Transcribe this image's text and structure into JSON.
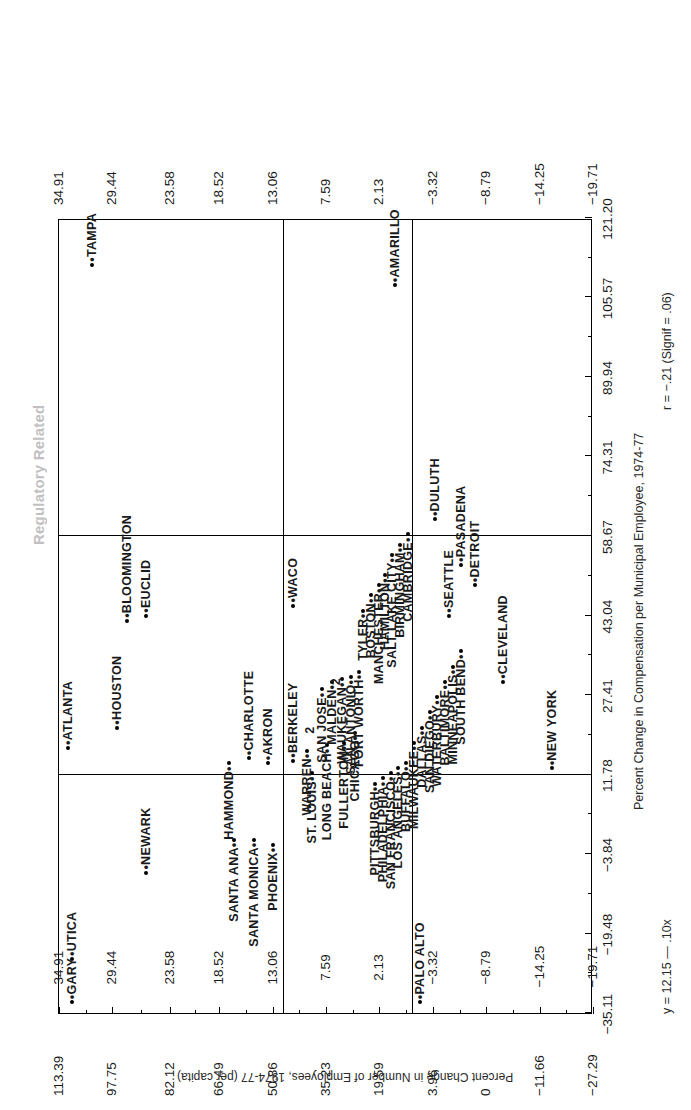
{
  "running_title": "Regulatory Related",
  "chart_data": {
    "type": "scatter",
    "title": "Regulatory Related",
    "xlabel": "Percent Change in Compensation per Municipal Employee, 1974-77",
    "ylabel": "Percent Change in Number of Employees, 1974-77 (per capita)",
    "annotations": {
      "equation": "y = 12.15 — .10x",
      "correlation": "r = −.21 (Signif = .06)"
    },
    "grid": false,
    "legend": "none",
    "xlim": [
      -35.11,
      121.2
    ],
    "ylim": [
      -19.71,
      34.91
    ],
    "xticks": [
      "-35.11",
      "-19.48",
      "-3.84",
      "11.78",
      "27.41",
      "43.04",
      "58.67",
      "74.31",
      "89.94",
      "105.57",
      "121.20"
    ],
    "yticks": [
      "34.91",
      "29.44",
      "23.58",
      "18.52",
      "13.06",
      "7.59",
      "2.13",
      "-3.32",
      "-8.79",
      "-14.25",
      "-19.71"
    ],
    "yticks_plotside": [
      "-27.29",
      "-11.66",
      "0",
      "3.96",
      "19.59",
      "35.23",
      "50.86",
      "66.49",
      "82.12",
      "97.75",
      "113.39"
    ],
    "overplot_marker_label": "2",
    "points": [
      {
        "label": "GARY",
        "x": -33.0,
        "y": 33.6,
        "anchor": "left"
      },
      {
        "label": "UTICA",
        "x": -24.5,
        "y": 33.6,
        "anchor": "left"
      },
      {
        "label": "PALO ALTO",
        "x": -33.0,
        "y": -2.0,
        "anchor": "left"
      },
      {
        "label": "NEWARK",
        "x": -7.5,
        "y": 26.0,
        "anchor": "left"
      },
      {
        "label": "SANTA ANA",
        "x": -1.0,
        "y": 17.0,
        "anchor": "right"
      },
      {
        "label": "SANTA MONICA",
        "x": -1.0,
        "y": 15.0,
        "anchor": "right"
      },
      {
        "label": "PHOENIX",
        "x": -2.0,
        "y": 13.0,
        "anchor": "right"
      },
      {
        "label": "ATLANTA",
        "x": 17.0,
        "y": 34.0,
        "anchor": "left"
      },
      {
        "label": "HOUSTON",
        "x": 21.0,
        "y": 29.0,
        "anchor": "left"
      },
      {
        "label": "HAMMOND",
        "x": 14.0,
        "y": 17.5,
        "anchor": "right"
      },
      {
        "label": "CHARLOTTE",
        "x": 15.0,
        "y": 15.5,
        "anchor": "left"
      },
      {
        "label": "AKRON",
        "x": 14.0,
        "y": 13.5,
        "anchor": "left"
      },
      {
        "label": "BERKELEY",
        "x": 14.5,
        "y": 11.0,
        "anchor": "left"
      },
      {
        "label": "BLOOMINGTON",
        "x": 42.0,
        "y": 28.0,
        "anchor": "left"
      },
      {
        "label": "EUCLID",
        "x": 43.0,
        "y": 26.0,
        "anchor": "left"
      },
      {
        "label": "WACO",
        "x": 45.0,
        "y": 11.0,
        "anchor": "left"
      },
      {
        "label": "ST. LOUIS",
        "x": 12.0,
        "y": 9.0,
        "anchor": "right"
      },
      {
        "label": "WARREN",
        "x": 16.5,
        "y": 9.5,
        "anchor": "right"
      },
      {
        "label": "LONG BEACH",
        "x": 17.5,
        "y": 7.5,
        "anchor": "right"
      },
      {
        "label": "FULLERTON",
        "x": 18.0,
        "y": 5.8,
        "anchor": "right"
      },
      {
        "label": "CHICAGO",
        "x": 20.0,
        "y": 4.6,
        "anchor": "right"
      },
      {
        "label": "SAN JOSE",
        "x": 28.5,
        "y": 8.0,
        "anchor": "right"
      },
      {
        "label": "MALDEN",
        "x": 30.0,
        "y": 7.0,
        "anchor": "right"
      },
      {
        "label": "WAUKEGAN",
        "x": 30.5,
        "y": 6.0,
        "anchor": "right"
      },
      {
        "label": "SAN ANTONIO",
        "x": 31.0,
        "y": 5.0,
        "anchor": "right"
      },
      {
        "label": "FORT WORTH",
        "x": 32.0,
        "y": 4.2,
        "anchor": "right"
      },
      {
        "label": "TYLER",
        "x": 44.0,
        "y": 3.8,
        "anchor": "right"
      },
      {
        "label": "BOSTON",
        "x": 47.0,
        "y": 3.0,
        "anchor": "right"
      },
      {
        "label": "MANCHESTER",
        "x": 49.0,
        "y": 2.2,
        "anchor": "right"
      },
      {
        "label": "HAMILTON",
        "x": 51.0,
        "y": 1.6,
        "anchor": "right"
      },
      {
        "label": "SALT LAKE CITY",
        "x": 55.0,
        "y": 0.8,
        "anchor": "right"
      },
      {
        "label": "BIRMINGHAM",
        "x": 57.0,
        "y": 0.0,
        "anchor": "right"
      },
      {
        "label": "CAMBRIDGE",
        "x": 59.0,
        "y": -0.8,
        "anchor": "right"
      },
      {
        "label": "PITTSBURGH",
        "x": 10.0,
        "y": 2.6,
        "anchor": "right"
      },
      {
        "label": "PHILADELPHIA",
        "x": 11.0,
        "y": 1.8,
        "anchor": "right"
      },
      {
        "label": "SAN FRANCISCO",
        "x": 12.0,
        "y": 1.0,
        "anchor": "right"
      },
      {
        "label": "LOS ANGELES",
        "x": 13.0,
        "y": 0.2,
        "anchor": "right"
      },
      {
        "label": "BUFFALO",
        "x": 14.0,
        "y": -0.6,
        "anchor": "right"
      },
      {
        "label": "MILWAUKEE",
        "x": 18.0,
        "y": -1.4,
        "anchor": "right"
      },
      {
        "label": "DALLAS",
        "x": 21.0,
        "y": -2.2,
        "anchor": "right"
      },
      {
        "label": "SAN DIEGO",
        "x": 24.0,
        "y": -3.0,
        "anchor": "right"
      },
      {
        "label": "WATERBURY",
        "x": 27.0,
        "y": -3.8,
        "anchor": "right"
      },
      {
        "label": "BALTIMORE",
        "x": 30.0,
        "y": -4.6,
        "anchor": "right"
      },
      {
        "label": "MINNEAPOLIS",
        "x": 33.0,
        "y": -5.4,
        "anchor": "right"
      },
      {
        "label": "SOUTH BEND",
        "x": 36.0,
        "y": -6.2,
        "anchor": "right"
      },
      {
        "label": "SEATTLE",
        "x": 43.0,
        "y": -5.0,
        "anchor": "left"
      },
      {
        "label": "DULUTH",
        "x": 62.0,
        "y": -3.6,
        "anchor": "left"
      },
      {
        "label": "PASADENA",
        "x": 53.0,
        "y": -6.2,
        "anchor": "left"
      },
      {
        "label": "DETROIT",
        "x": 49.0,
        "y": -7.6,
        "anchor": "left"
      },
      {
        "label": "CLEVELAND",
        "x": 30.0,
        "y": -10.5,
        "anchor": "left"
      },
      {
        "label": "NEW YORK",
        "x": 13.0,
        "y": -15.5,
        "anchor": "left"
      },
      {
        "label": "TAMPA",
        "x": 112.0,
        "y": 31.5,
        "anchor": "left"
      },
      {
        "label": "AMARILLO",
        "x": 108.0,
        "y": 0.5,
        "anchor": "left"
      }
    ]
  }
}
